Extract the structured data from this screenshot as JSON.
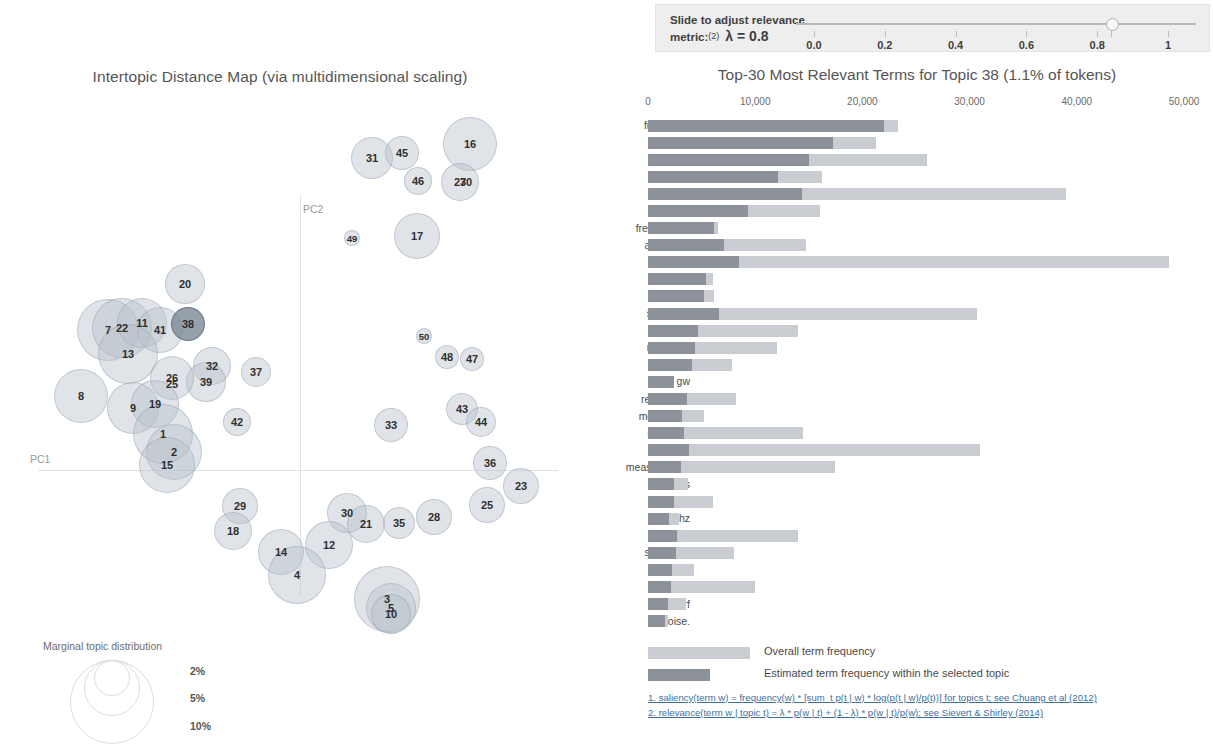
{
  "map": {
    "title": "Intertopic Distance Map (via multidimensional scaling)",
    "axis_x_label": "PC1",
    "axis_y_label": "PC2",
    "marginal_legend": {
      "title": "Marginal topic distribution",
      "pct_2": "2%",
      "pct_5": "5%",
      "pct_10": "10%"
    },
    "selected_topic": 38,
    "bubbles": [
      {
        "id": "16",
        "x": 470,
        "y": 144,
        "r": 27,
        "selected": false
      },
      {
        "id": "31",
        "x": 372,
        "y": 158,
        "r": 21,
        "selected": false
      },
      {
        "id": "45",
        "x": 402,
        "y": 153,
        "r": 17,
        "selected": false
      },
      {
        "id": "46",
        "x": 418,
        "y": 181,
        "r": 14,
        "selected": false
      },
      {
        "id": "27",
        "x": 460,
        "y": 182,
        "r": 19,
        "selected": false
      },
      {
        "id": "30b",
        "x": 466,
        "y": 182,
        "r": 0,
        "selected": false
      },
      {
        "id": "49",
        "x": 352,
        "y": 238,
        "r": 8,
        "selected": false
      },
      {
        "id": "17",
        "x": 417,
        "y": 236,
        "r": 23,
        "selected": false
      },
      {
        "id": "20",
        "x": 185,
        "y": 284,
        "r": 20,
        "selected": false
      },
      {
        "id": "7",
        "x": 108,
        "y": 330,
        "r": 31,
        "selected": false
      },
      {
        "id": "22",
        "x": 122,
        "y": 328,
        "r": 30,
        "selected": false
      },
      {
        "id": "11",
        "x": 142,
        "y": 323,
        "r": 25,
        "selected": false
      },
      {
        "id": "41",
        "x": 160,
        "y": 330,
        "r": 23,
        "selected": false
      },
      {
        "id": "38",
        "x": 188,
        "y": 324,
        "r": 17,
        "selected": true
      },
      {
        "id": "13",
        "x": 128,
        "y": 354,
        "r": 30,
        "selected": false
      },
      {
        "id": "32",
        "x": 212,
        "y": 366,
        "r": 19,
        "selected": false
      },
      {
        "id": "39",
        "x": 206,
        "y": 382,
        "r": 20,
        "selected": false
      },
      {
        "id": "37",
        "x": 256,
        "y": 372,
        "r": 15,
        "selected": false
      },
      {
        "id": "8",
        "x": 81,
        "y": 396,
        "r": 27,
        "selected": false
      },
      {
        "id": "26",
        "x": 172,
        "y": 378,
        "r": 22,
        "selected": false
      },
      {
        "id": "25b",
        "x": 172,
        "y": 384,
        "r": 0,
        "selected": false
      },
      {
        "id": "9",
        "x": 133,
        "y": 408,
        "r": 26,
        "selected": false
      },
      {
        "id": "19",
        "x": 155,
        "y": 404,
        "r": 24,
        "selected": false
      },
      {
        "id": "1",
        "x": 163,
        "y": 434,
        "r": 30,
        "selected": false
      },
      {
        "id": "2",
        "x": 174,
        "y": 452,
        "r": 28,
        "selected": false
      },
      {
        "id": "15",
        "x": 167,
        "y": 465,
        "r": 28,
        "selected": false
      },
      {
        "id": "42",
        "x": 237,
        "y": 422,
        "r": 14,
        "selected": false
      },
      {
        "id": "50",
        "x": 424,
        "y": 336,
        "r": 8,
        "selected": false
      },
      {
        "id": "48",
        "x": 447,
        "y": 357,
        "r": 12,
        "selected": false
      },
      {
        "id": "47",
        "x": 472,
        "y": 359,
        "r": 12,
        "selected": false
      },
      {
        "id": "33",
        "x": 391,
        "y": 425,
        "r": 17,
        "selected": false
      },
      {
        "id": "43",
        "x": 462,
        "y": 409,
        "r": 16,
        "selected": false
      },
      {
        "id": "44",
        "x": 481,
        "y": 422,
        "r": 15,
        "selected": false
      },
      {
        "id": "36",
        "x": 490,
        "y": 463,
        "r": 17,
        "selected": false
      },
      {
        "id": "23",
        "x": 521,
        "y": 486,
        "r": 18,
        "selected": false
      },
      {
        "id": "25",
        "x": 487,
        "y": 505,
        "r": 18,
        "selected": false
      },
      {
        "id": "29",
        "x": 240,
        "y": 506,
        "r": 18,
        "selected": false
      },
      {
        "id": "18",
        "x": 233,
        "y": 531,
        "r": 19,
        "selected": false
      },
      {
        "id": "28",
        "x": 434,
        "y": 517,
        "r": 18,
        "selected": false
      },
      {
        "id": "35",
        "x": 399,
        "y": 523,
        "r": 16,
        "selected": false
      },
      {
        "id": "30",
        "x": 347,
        "y": 513,
        "r": 20,
        "selected": false
      },
      {
        "id": "21",
        "x": 366,
        "y": 524,
        "r": 19,
        "selected": false
      },
      {
        "id": "12",
        "x": 329,
        "y": 545,
        "r": 24,
        "selected": false
      },
      {
        "id": "14",
        "x": 281,
        "y": 552,
        "r": 23,
        "selected": false
      },
      {
        "id": "4",
        "x": 297,
        "y": 575,
        "r": 29,
        "selected": false
      },
      {
        "id": "3",
        "x": 387,
        "y": 599,
        "r": 33,
        "selected": false
      },
      {
        "id": "5",
        "x": 391,
        "y": 608,
        "r": 25,
        "selected": false
      },
      {
        "id": "10",
        "x": 391,
        "y": 614,
        "r": 20,
        "selected": false
      }
    ]
  },
  "slider": {
    "label_line1": "Slide to adjust relevance",
    "label_line2": "metric:",
    "footnote_marker": "(2)",
    "lambda_text": "λ = 0.8",
    "value": 0.8,
    "ticks": [
      "0.0",
      "0.2",
      "0.4",
      "0.6",
      "0.8",
      "1"
    ]
  },
  "legend": {
    "overall_label": "Overall term frequency",
    "estimated_label": "Estimated term frequency within the selected topic",
    "overall_color": "#c9ccd1",
    "estimated_color": "#8d9199"
  },
  "footnotes": [
    "1. saliency(term w) = frequency(w) * [sum_t p(t | w) * log(p(t | w)/p(t))] for topics t; see Chuang et al (2012)",
    "2. relevance(term w | topic t) = λ * p(w | t) + (1 - λ) * p(w | t)/p(w); see Sievert & Shirley (2014)"
  ],
  "chart_data": {
    "type": "bar",
    "title": "Top-30 Most Relevant Terms for Topic 38 (1.1% of tokens)",
    "topic": 38,
    "topic_token_share": "1.1%",
    "xlabel": "",
    "ylabel": "",
    "xlim": [
      0,
      50000
    ],
    "xticks": [
      0,
      10000,
      20000,
      30000,
      40000,
      50000
    ],
    "xtick_labels": [
      "0",
      "10,000",
      "20,000",
      "30,000",
      "40,000",
      "50,000"
    ],
    "grid": false,
    "legend_position": "bottom",
    "categories": [
      "frequency",
      "noise",
      "signal",
      "mode",
      "power",
      "modes",
      "frequencies",
      "amplitude",
      "phase",
      "pulse",
      "signals",
      "spectrum",
      "fourier",
      "response",
      "filter",
      "gw",
      "resonance",
      "modulation",
      "detection",
      "spectral",
      "measurement",
      "pulses",
      "delay",
      "hz",
      "output",
      "sensitivity",
      "voltage",
      "shift",
      "rf",
      "noise."
    ],
    "series": [
      {
        "name": "Overall term frequency",
        "color": "#c9ccd1",
        "values": [
          23300,
          21300,
          26000,
          16200,
          39000,
          16000,
          6500,
          14700,
          48600,
          6100,
          6200,
          30700,
          14000,
          12000,
          7800,
          2400,
          8200,
          5200,
          14500,
          31000,
          17400,
          3700,
          6100,
          2900,
          14000,
          8000,
          4300,
          10000,
          3500,
          1900
        ]
      },
      {
        "name": "Estimated term frequency within the selected topic",
        "color": "#8d9199",
        "values": [
          22000,
          17300,
          15000,
          12100,
          14400,
          9300,
          6200,
          7100,
          8500,
          5400,
          5200,
          6600,
          4700,
          4400,
          4100,
          2400,
          3600,
          3200,
          3400,
          3800,
          3100,
          2400,
          2400,
          2000,
          2700,
          2600,
          2200,
          2100,
          1900,
          1600
        ]
      }
    ]
  }
}
